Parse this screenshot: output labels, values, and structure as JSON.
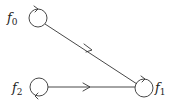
{
  "diagram": {
    "type": "directed-graph",
    "nodes": [
      {
        "id": "f0",
        "label": "f",
        "subscript": "0",
        "x": 38,
        "y": 18,
        "self_loop": true,
        "loop_arrow": "top-right"
      },
      {
        "id": "f1",
        "label": "f",
        "subscript": "1",
        "x": 144,
        "y": 88,
        "self_loop": true,
        "loop_arrow": "top-right"
      },
      {
        "id": "f2",
        "label": "f",
        "subscript": "2",
        "x": 39,
        "y": 87,
        "self_loop": true,
        "loop_arrow": "bottom-left"
      }
    ],
    "edges": [
      {
        "from": "f0",
        "to": "f1",
        "arrow": "midpoint"
      },
      {
        "from": "f2",
        "to": "f1",
        "arrow": "midpoint"
      },
      {
        "from": "f0",
        "to": "f0",
        "arrow": "loop"
      },
      {
        "from": "f1",
        "to": "f1",
        "arrow": "loop"
      },
      {
        "from": "f2",
        "to": "f2",
        "arrow": "loop"
      }
    ],
    "colors": {
      "stroke": "#333333",
      "text": "#222222",
      "background": "#ffffff"
    }
  }
}
